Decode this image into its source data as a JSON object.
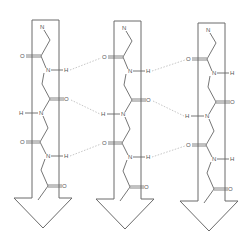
{
  "diagram": {
    "type": "antiparallel/parallel beta-sheet with hydrogen bonds",
    "colors": {
      "outline": "#6a6a6a",
      "bond": "#666666",
      "hbond": "#b8b8b8",
      "background": "#ffffff"
    },
    "strands": [
      {
        "id": "strand-1",
        "dx": 0,
        "dy": 0
      },
      {
        "id": "strand-2",
        "dx": 82,
        "dy": 1
      },
      {
        "id": "strand-3",
        "dx": 166,
        "dy": 3
      }
    ],
    "atom_labels": {
      "n_term": "N",
      "carbonyl_o": "O",
      "amide_n": "N",
      "amide_h": "H"
    },
    "hbonds": [
      {
        "from": "strand-1 N-H",
        "to": "strand-2 C=O"
      },
      {
        "from": "strand-1 C=O",
        "to": "strand-2 H-N"
      },
      {
        "from": "strand-1 N-H",
        "to": "strand-2 C=O"
      },
      {
        "from": "strand-2 N-H",
        "to": "strand-3 C=O"
      },
      {
        "from": "strand-2 C=O",
        "to": "strand-3 H-N"
      },
      {
        "from": "strand-2 N-H",
        "to": "strand-3 C=O"
      }
    ]
  }
}
